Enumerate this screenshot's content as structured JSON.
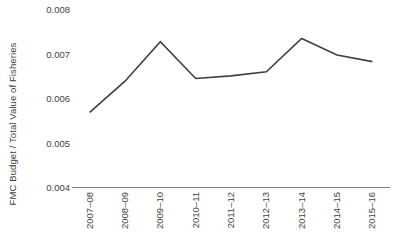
{
  "chart_data": {
    "type": "line",
    "title": "",
    "xlabel": "",
    "ylabel": "FMC Budget / Total Value of Fisheries",
    "categories": [
      "2007–08",
      "2008–09",
      "2009–10",
      "2010–11",
      "2011–12",
      "2012–13",
      "2013–14",
      "2014–15",
      "2015–16"
    ],
    "values": [
      0.0057,
      0.0064,
      0.00729,
      0.00646,
      0.00652,
      0.00661,
      0.00736,
      0.00699,
      0.00684
    ],
    "series": [
      {
        "name": "FMC Budget / Total Value of Fisheries",
        "values": [
          0.0057,
          0.0064,
          0.00729,
          0.00646,
          0.00652,
          0.00661,
          0.00736,
          0.00699,
          0.00684
        ]
      }
    ],
    "ylim": [
      0.004,
      0.008
    ],
    "yticks": [
      0.004,
      0.005,
      0.006,
      0.007,
      0.008
    ],
    "ytick_labels": [
      "0.004",
      "0.005",
      "0.006",
      "0.007",
      "0.008"
    ],
    "grid": false,
    "legend": false,
    "legend_position": "none",
    "line_color": "#404040",
    "axis_color": "#808080",
    "text_color": "#3f3f3f",
    "background": "#ffffff"
  }
}
